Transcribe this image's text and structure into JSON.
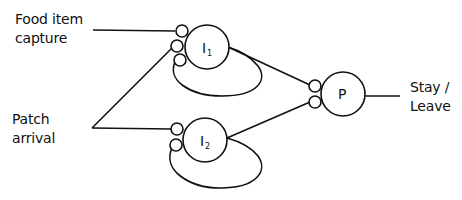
{
  "inputs": {
    "food": {
      "line1": "Food item",
      "line2": "capture"
    },
    "patch": {
      "line1": "Patch",
      "line2": "arrival"
    }
  },
  "nodes": {
    "i1": {
      "letter": "I",
      "subscript": "1"
    },
    "i2": {
      "letter": "I",
      "subscript": "2"
    },
    "p": {
      "letter": "P"
    }
  },
  "output": {
    "line1": "Stay /",
    "line2": "Leave"
  },
  "colors": {
    "stroke": "#111111",
    "background": "#ffffff"
  }
}
